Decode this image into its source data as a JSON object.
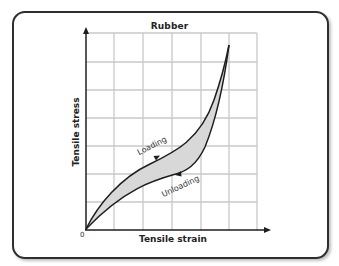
{
  "figure": {
    "title": "Rubber",
    "x_axis_label": "Tensile strain",
    "y_axis_label": "Tensile stress",
    "origin_label": "0",
    "curve_labels": {
      "loading": "Loading",
      "unloading": "Unloading"
    },
    "colors": {
      "border": "#2e2e2e",
      "grid": "#c8c8c8",
      "curve": "#1e1e1e",
      "hysteresis_fill": "#d8d8d8",
      "axis": "#1e1e1e"
    },
    "grid": {
      "columns": 6,
      "rows": 7
    }
  }
}
